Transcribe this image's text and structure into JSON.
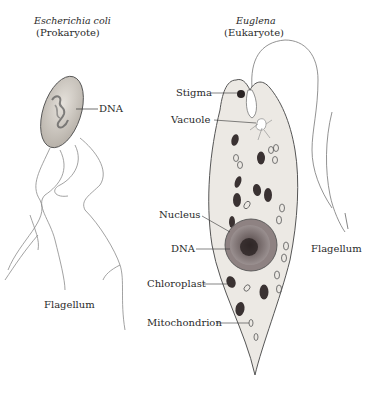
{
  "diagram": {
    "left_organism": {
      "name": "Escherichia coli",
      "type": "(Prokaryote)",
      "labels": {
        "dna": "DNA",
        "flagellum": "Flagellum"
      }
    },
    "right_organism": {
      "name": "Euglena",
      "type": "(Eukaryote)",
      "labels": {
        "stigma": "Stigma",
        "vacuole": "Vacuole",
        "nucleus": "Nucleus",
        "dna": "DNA",
        "chloroplast": "Chloroplast",
        "mitochondrion": "Mitochondrion",
        "flagellum": "Flagellum"
      }
    }
  }
}
